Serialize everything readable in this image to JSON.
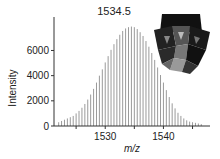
{
  "chart_data": {
    "type": "bar",
    "title": "",
    "xlabel": "m/z",
    "ylabel": "Intensity",
    "xlim": [
      1521.2,
      1548.0
    ],
    "ylim": [
      0,
      8500
    ],
    "xticks": [
      1530,
      1540
    ],
    "xtick_labels": [
      "1530",
      "1540"
    ],
    "yticks": [
      0,
      2000,
      4000,
      6000
    ],
    "ytick_labels": [
      "0",
      "2000",
      "4000",
      "6000"
    ],
    "grid": false,
    "legend": null,
    "annotations": [
      {
        "text": "1534.5",
        "x": 1534.5,
        "note": "most abundant isotopic peak"
      }
    ],
    "inset": "polyhedral cluster structure model (grayscale)",
    "series": [
      {
        "name": "isotopic envelope",
        "x": [
          1522.0,
          1522.5,
          1523.0,
          1523.5,
          1524.0,
          1524.5,
          1525.0,
          1525.5,
          1526.0,
          1526.5,
          1527.0,
          1527.5,
          1528.0,
          1528.5,
          1529.0,
          1529.5,
          1530.0,
          1530.5,
          1531.0,
          1531.5,
          1532.0,
          1532.5,
          1533.0,
          1533.5,
          1534.0,
          1534.5,
          1535.0,
          1535.5,
          1536.0,
          1536.5,
          1537.0,
          1537.5,
          1538.0,
          1538.5,
          1539.0,
          1539.5,
          1540.0,
          1540.5,
          1541.0,
          1541.5,
          1542.0,
          1542.5,
          1543.0,
          1543.5,
          1544.0,
          1544.5,
          1545.0,
          1545.5,
          1546.0,
          1546.5
        ],
        "values": [
          300,
          400,
          500,
          600,
          700,
          800,
          1000,
          1200,
          1450,
          1750,
          2100,
          2500,
          2950,
          3450,
          4000,
          4500,
          5050,
          5550,
          6050,
          6500,
          6900,
          7250,
          7550,
          7750,
          7850,
          7900,
          7850,
          7700,
          7450,
          7150,
          6750,
          6300,
          5800,
          5250,
          4650,
          4050,
          3450,
          2850,
          2300,
          1800,
          1400,
          1050,
          800,
          600,
          450,
          350,
          300,
          250,
          200,
          150
        ]
      }
    ]
  },
  "labels": {
    "peak_annotation": "1534.5",
    "xlabel": "m/z",
    "ylabel": "Intensity",
    "xticks": [
      "1530",
      "1540"
    ],
    "yticks": [
      "0",
      "2000",
      "4000",
      "6000"
    ]
  },
  "colors": {
    "bars": "#9a9a9a",
    "axis": "#333333",
    "text": "#222222"
  }
}
